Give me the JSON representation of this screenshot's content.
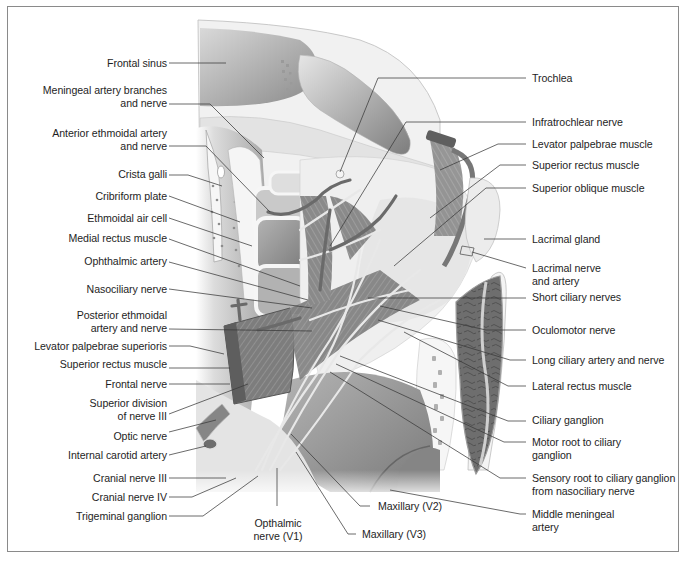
{
  "figure": {
    "colors": {
      "frame": "#8a8a8a",
      "bone_light": "#ececec",
      "sinus_dark": "#8e8e8e",
      "muscle": "#7a7a7a",
      "nerve": "#dcdcdc",
      "leader_line": "#3a3a3a",
      "text": "#1e1e1e"
    }
  },
  "labels_left": [
    {
      "id": "frontal-sinus",
      "lines": [
        "Frontal sinus"
      ]
    },
    {
      "id": "meningeal-artery-branches",
      "lines": [
        "Meningeal artery branches",
        "and nerve"
      ]
    },
    {
      "id": "anterior-ethmoidal-artery",
      "lines": [
        "Anterior ethmoidal artery",
        "and nerve"
      ]
    },
    {
      "id": "crista-galli",
      "lines": [
        "Crista galli"
      ]
    },
    {
      "id": "cribriform-plate",
      "lines": [
        "Cribriform plate"
      ]
    },
    {
      "id": "ethmoidal-air-cell",
      "lines": [
        "Ethmoidal air cell"
      ]
    },
    {
      "id": "medial-rectus-muscle",
      "lines": [
        "Medial rectus muscle"
      ]
    },
    {
      "id": "ophthalmic-artery",
      "lines": [
        "Ophthalmic artery"
      ]
    },
    {
      "id": "nasociliary-nerve",
      "lines": [
        "Nasociliary nerve"
      ]
    },
    {
      "id": "posterior-ethmoidal-artery",
      "lines": [
        "Posterior ethmoidal",
        "artery and nerve"
      ]
    },
    {
      "id": "levator-palpebrae-superioris",
      "lines": [
        "Levator palpebrae superioris"
      ]
    },
    {
      "id": "superior-rectus-muscle-left",
      "lines": [
        "Superior rectus muscle"
      ]
    },
    {
      "id": "frontal-nerve",
      "lines": [
        "Frontal nerve"
      ]
    },
    {
      "id": "superior-division-nerve-iii",
      "lines": [
        "Superior division",
        "of nerve III"
      ]
    },
    {
      "id": "optic-nerve",
      "lines": [
        "Optic nerve"
      ]
    },
    {
      "id": "internal-carotid-artery",
      "lines": [
        "Internal carotid artery"
      ]
    },
    {
      "id": "cranial-nerve-iii",
      "lines": [
        "Cranial nerve III"
      ]
    },
    {
      "id": "cranial-nerve-iv",
      "lines": [
        "Cranial nerve IV"
      ]
    },
    {
      "id": "trigeminal-ganglion",
      "lines": [
        "Trigeminal ganglion"
      ]
    }
  ],
  "labels_right": [
    {
      "id": "trochlea",
      "lines": [
        "Trochlea"
      ]
    },
    {
      "id": "infratrochlear-nerve",
      "lines": [
        "Infratrochlear nerve"
      ]
    },
    {
      "id": "levator-palpebrae-muscle",
      "lines": [
        "Levator palpebrae muscle"
      ]
    },
    {
      "id": "superior-rectus-muscle-right",
      "lines": [
        "Superior rectus muscle"
      ]
    },
    {
      "id": "superior-oblique-muscle",
      "lines": [
        "Superior oblique muscle"
      ]
    },
    {
      "id": "lacrimal-gland",
      "lines": [
        "Lacrimal gland"
      ]
    },
    {
      "id": "lacrimal-nerve-artery",
      "lines": [
        "Lacrimal nerve",
        "and artery"
      ]
    },
    {
      "id": "short-ciliary-nerves",
      "lines": [
        "Short ciliary nerves"
      ]
    },
    {
      "id": "oculomotor-nerve",
      "lines": [
        "Oculomotor nerve"
      ]
    },
    {
      "id": "long-ciliary-artery-nerve",
      "lines": [
        "Long ciliary artery and nerve"
      ]
    },
    {
      "id": "lateral-rectus-muscle",
      "lines": [
        "Lateral rectus muscle"
      ]
    },
    {
      "id": "ciliary-ganglion",
      "lines": [
        "Ciliary ganglion"
      ]
    },
    {
      "id": "motor-root-ciliary-ganglion",
      "lines": [
        "Motor root to ciliary",
        "ganglion"
      ]
    },
    {
      "id": "sensory-root-ciliary-ganglion",
      "lines": [
        "Sensory root to ciliary ganglion",
        "from nasociliary nerve"
      ]
    },
    {
      "id": "middle-meningeal-artery",
      "lines": [
        "Middle meningeal",
        "artery"
      ]
    }
  ],
  "labels_bottom": [
    {
      "id": "opthalmic-nerve-v1",
      "lines": [
        "Opthalmic",
        "nerve (V1)"
      ]
    },
    {
      "id": "maxillary-v2",
      "lines": [
        "Maxillary (V2)"
      ]
    },
    {
      "id": "maxillary-v3",
      "lines": [
        "Maxillary (V3)"
      ]
    }
  ]
}
